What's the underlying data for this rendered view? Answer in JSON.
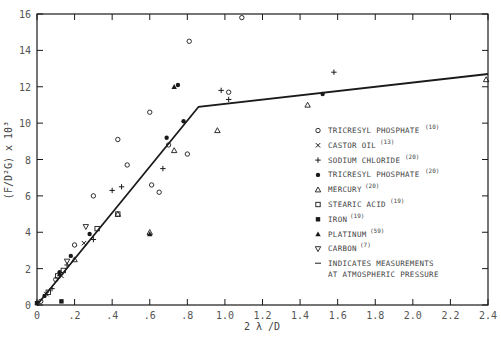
{
  "chart_data": {
    "type": "scatter",
    "title": "",
    "xlabel": "2 λ /D",
    "ylabel": "(F/D²G) x 10³",
    "xlim": [
      0,
      2.4
    ],
    "ylim": [
      0,
      16
    ],
    "grid": false,
    "legend_position": "right-center",
    "x_ticks": [
      "0",
      ".2",
      ".4",
      ".6",
      ".8",
      "1.0",
      "1.2",
      "1.4",
      "1.6",
      "1.8",
      "2.0",
      "2.2",
      "2.4"
    ],
    "y_ticks": [
      "0",
      "2",
      "4",
      "6",
      "8",
      "10",
      "12",
      "14",
      "16"
    ],
    "fit_line": {
      "name": "fitted curve",
      "x": [
        0,
        0.86,
        2.4
      ],
      "y": [
        0,
        10.9,
        12.7
      ]
    },
    "series": [
      {
        "name": "TRICRESYL PHOSPHATE",
        "ref": "(10)",
        "marker": "open-circle",
        "x": [
          0.02,
          0.1,
          0.2,
          0.3,
          0.43,
          0.48,
          0.6,
          0.65,
          0.8,
          0.81,
          1.09,
          1.02,
          0.61,
          0.7
        ],
        "y": [
          0.2,
          1.4,
          3.3,
          6.0,
          9.1,
          7.7,
          10.6,
          6.2,
          8.3,
          14.5,
          15.8,
          11.7,
          6.6,
          8.8
        ]
      },
      {
        "name": "CASTOR OIL",
        "ref": "(13)",
        "marker": "x",
        "x": [
          0.05,
          0.13,
          0.25
        ],
        "y": [
          0.6,
          1.6,
          3.4
        ]
      },
      {
        "name": "SODIUM CHLORIDE",
        "ref": "(20)",
        "marker": "plus",
        "x": [
          0.08,
          0.16,
          0.3,
          0.4,
          0.45,
          0.67,
          0.98,
          1.02,
          1.58
        ],
        "y": [
          0.9,
          2.2,
          3.6,
          6.3,
          6.5,
          7.5,
          11.8,
          11.3,
          12.8
        ]
      },
      {
        "name": "TRICRESYL PHOSPHATE",
        "ref": "(20)",
        "marker": "filled-circle",
        "x": [
          0.04,
          0.12,
          0.18,
          0.28,
          0.69,
          0.75,
          0.78,
          1.52
        ],
        "y": [
          0.5,
          1.8,
          2.7,
          3.9,
          9.2,
          12.1,
          10.1,
          11.6
        ]
      },
      {
        "name": "MERCURY",
        "ref": "(20)",
        "marker": "open-triangle",
        "x": [
          0.2,
          0.43,
          0.6,
          0.73,
          0.96,
          1.44,
          2.39
        ],
        "y": [
          2.5,
          5.0,
          4.0,
          8.5,
          9.6,
          11.0,
          12.4
        ]
      },
      {
        "name": "STEARIC ACID",
        "ref": "(19)",
        "marker": "open-square",
        "x": [
          0.06,
          0.11,
          0.14,
          0.32,
          0.43
        ],
        "y": [
          0.7,
          1.6,
          1.9,
          4.2,
          5.0
        ]
      },
      {
        "name": "IRON",
        "ref": "(19)",
        "marker": "filled-square",
        "x": [
          0.0,
          0.13
        ],
        "y": [
          0.1,
          0.2
        ]
      },
      {
        "name": "PLATINUM",
        "ref": "(59)",
        "marker": "filled-triangle",
        "x": [
          0.12,
          0.6,
          0.73
        ],
        "y": [
          1.7,
          3.9,
          12.0
        ]
      },
      {
        "name": "CARBON",
        "ref": "(7)",
        "marker": "open-inverted-triangle",
        "x": [
          0.16,
          0.26
        ],
        "y": [
          2.4,
          4.3
        ]
      }
    ],
    "annotations": [
      "— INDICATES MEASUREMENTS AT ATMOSPHERIC PRESSURE"
    ]
  },
  "legend": {
    "items": [
      {
        "glyph": "o",
        "label": "TRICRESYL PHOSPHATE",
        "ref": "(10)"
      },
      {
        "glyph": "×",
        "label": "CASTOR OIL",
        "ref": "(13)"
      },
      {
        "glyph": "+",
        "label": "SODIUM CHLORIDE",
        "ref": "(20)"
      },
      {
        "glyph": "•",
        "label": "TRICRESYL PHOSPHATE",
        "ref": "(20)"
      },
      {
        "glyph": "△",
        "label": "MERCURY",
        "ref": "(20)"
      },
      {
        "glyph": "□",
        "label": "STEARIC ACID",
        "ref": "(19)"
      },
      {
        "glyph": "■",
        "label": "IRON",
        "ref": "(19)"
      },
      {
        "glyph": "▲",
        "label": "PLATINUM",
        "ref": "(59)"
      },
      {
        "glyph": "▽",
        "label": "CARBON",
        "ref": "(7)"
      }
    ],
    "note_line1": "INDICATES MEASUREMENTS",
    "note_line2": "AT ATMOSPHERIC PRESSURE"
  },
  "axes": {
    "x_title": "2 λ /D",
    "y_title": "(F/D²G) x 10³"
  },
  "colors": {
    "ink": "#1a1a1a",
    "text": "#555555",
    "background": "#ffffff"
  }
}
